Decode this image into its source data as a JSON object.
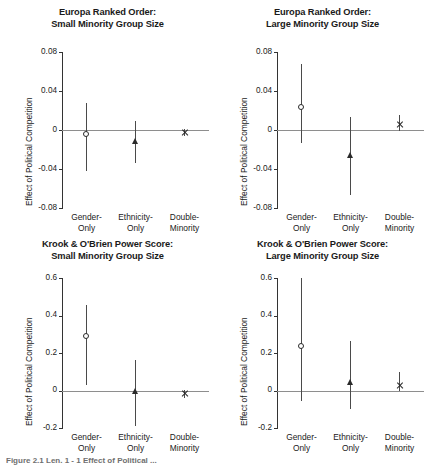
{
  "figure": {
    "caption_partial": "Figure 2.1 Len. 1 - 1 Effect of Political ..."
  },
  "common": {
    "ylabel": "Effect of Political Competition",
    "categories": [
      {
        "line1": "Gender-",
        "line2": "Only",
        "marker": "circle"
      },
      {
        "line1": "Ethnicity-",
        "line2": "Only",
        "marker": "triangle"
      },
      {
        "line1": "Double-",
        "line2": "Minority",
        "marker": "x"
      }
    ],
    "zero_line_color": "#8e8e8e",
    "axis_color": "#333333",
    "marker_color": "#2a2a2a"
  },
  "chart_data": [
    {
      "type": "scatter",
      "panel_id": "europa-small",
      "title_line1": "Europa Ranked Order:",
      "title_line2": "Small Minority Group Size",
      "xlabel": "",
      "ylabel": "Effect of Political Competition",
      "categories": [
        "Gender-Only",
        "Ethnicity-Only",
        "Double-Minority"
      ],
      "markers": [
        "circle",
        "triangle",
        "x"
      ],
      "values": [
        -0.005,
        -0.011,
        -0.003
      ],
      "ci_low": [
        -0.042,
        -0.034,
        -0.006
      ],
      "ci_high": [
        0.028,
        0.009,
        0.001
      ],
      "ylim": [
        -0.08,
        0.08
      ],
      "yticks": [
        0.08,
        0.04,
        0,
        -0.04,
        -0.08
      ],
      "ytick_labels": [
        "0.08",
        "0.04",
        "0",
        "-0.04",
        "-0.08"
      ],
      "grid": false,
      "zero_reference_line": true,
      "legend": "none"
    },
    {
      "type": "scatter",
      "panel_id": "europa-large",
      "title_line1": "Europa Ranked Order:",
      "title_line2": "Large Minority Group Size",
      "xlabel": "",
      "ylabel": "Effect of Political Competition",
      "categories": [
        "Gender-Only",
        "Ethnicity-Only",
        "Double-Minority"
      ],
      "markers": [
        "circle",
        "triangle",
        "x"
      ],
      "values": [
        0.023,
        -0.026,
        0.006
      ],
      "ci_low": [
        -0.013,
        -0.067,
        -0.001
      ],
      "ci_high": [
        0.068,
        0.013,
        0.015
      ],
      "ylim": [
        -0.08,
        0.08
      ],
      "yticks": [
        0.08,
        0.04,
        0,
        -0.04,
        -0.08
      ],
      "ytick_labels": [
        "0.08",
        "0.04",
        "0",
        "-0.04",
        "-0.08"
      ],
      "grid": false,
      "zero_reference_line": true,
      "legend": "none"
    },
    {
      "type": "scatter",
      "panel_id": "krook-small",
      "title_line1": "Krook & O'Brien Power Score:",
      "title_line2": "Small Minority Group Size",
      "xlabel": "",
      "ylabel": "Effect of Political Competition",
      "categories": [
        "Gender-Only",
        "Ethnicity-Only",
        "Double-Minority"
      ],
      "markers": [
        "circle",
        "triangle",
        "x"
      ],
      "values": [
        0.285,
        -0.005,
        -0.018
      ],
      "ci_low": [
        0.03,
        -0.19,
        -0.04
      ],
      "ci_high": [
        0.455,
        0.165,
        0.005
      ],
      "ylim": [
        -0.2,
        0.6
      ],
      "yticks": [
        0.6,
        0.4,
        0.2,
        0,
        -0.2
      ],
      "ytick_labels": [
        "0.6",
        "0.4",
        "0.2",
        "0",
        "-0.2"
      ],
      "grid": false,
      "zero_reference_line": true,
      "legend": "none"
    },
    {
      "type": "scatter",
      "panel_id": "krook-large",
      "title_line1": "Krook & O'Brien Power Score:",
      "title_line2": "Large Minority Group Size",
      "xlabel": "",
      "ylabel": "Effect of Political Competition",
      "categories": [
        "Gender-Only",
        "Ethnicity-Only",
        "Double-Minority"
      ],
      "markers": [
        "circle",
        "triangle",
        "x"
      ],
      "values": [
        0.232,
        0.045,
        0.028
      ],
      "ci_low": [
        -0.055,
        -0.1,
        -0.005
      ],
      "ci_high": [
        0.6,
        0.262,
        0.1
      ],
      "ylim": [
        -0.2,
        0.6
      ],
      "yticks": [
        0.6,
        0.4,
        0.2,
        0,
        -0.2
      ],
      "ytick_labels": [
        "0.6",
        "0.4",
        "0.2",
        "0",
        "-0.2"
      ],
      "grid": false,
      "zero_reference_line": true,
      "legend": "none"
    }
  ]
}
